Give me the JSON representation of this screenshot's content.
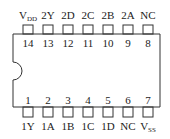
{
  "chip": {
    "body_color": "#333333",
    "background": "#ffffff",
    "notch": "left semicircle"
  },
  "top_pins": [
    {
      "number": "14",
      "label": "V",
      "sub": "DD"
    },
    {
      "number": "13",
      "label": "2Y",
      "sub": ""
    },
    {
      "number": "12",
      "label": "2D",
      "sub": ""
    },
    {
      "number": "11",
      "label": "2C",
      "sub": ""
    },
    {
      "number": "10",
      "label": "2B",
      "sub": ""
    },
    {
      "number": "9",
      "label": "2A",
      "sub": ""
    },
    {
      "number": "8",
      "label": "NC",
      "sub": ""
    }
  ],
  "bottom_pins": [
    {
      "number": "1",
      "label": "1Y",
      "sub": ""
    },
    {
      "number": "2",
      "label": "1A",
      "sub": ""
    },
    {
      "number": "3",
      "label": "1B",
      "sub": ""
    },
    {
      "number": "4",
      "label": "1C",
      "sub": ""
    },
    {
      "number": "5",
      "label": "1D",
      "sub": ""
    },
    {
      "number": "6",
      "label": "NC",
      "sub": ""
    },
    {
      "number": "7",
      "label": "V",
      "sub": "SS"
    }
  ]
}
